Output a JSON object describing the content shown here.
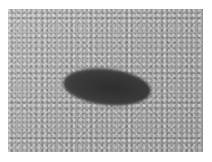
{
  "image": {
    "description": "Grayscale close-up photograph of a textured skin surface with a dark oval lesion near the center",
    "colors": {
      "border": "#ffffff",
      "background_texture": "#a9a9a9",
      "lesion": "#333333"
    }
  }
}
